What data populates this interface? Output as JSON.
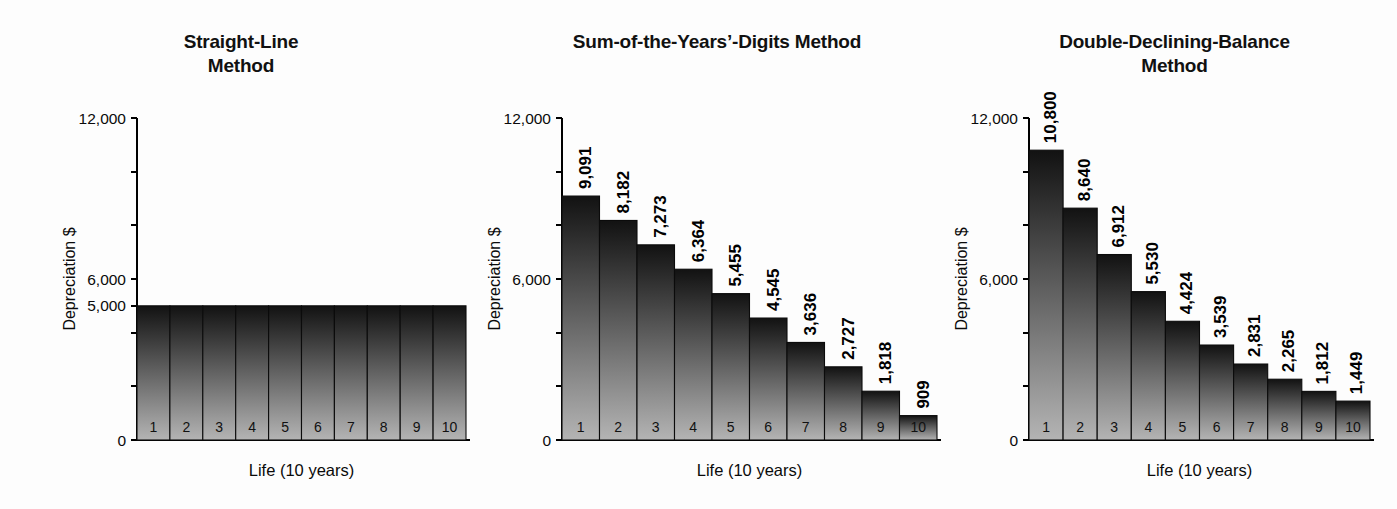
{
  "figure": {
    "background_color": "#fdfdfd",
    "bar_gradient_top_color": "#121212",
    "bar_gradient_bottom_color": "#b4b4b4",
    "axis_color": "#000000"
  },
  "chart_data": [
    {
      "type": "bar",
      "title": "Straight-Line\nMethod",
      "title_line1": "Straight-Line",
      "title_line2": "Method",
      "xlabel": "Life (10 years)",
      "ylabel": "Depreciation $",
      "categories": [
        "1",
        "2",
        "3",
        "4",
        "5",
        "6",
        "7",
        "8",
        "9",
        "10"
      ],
      "values": [
        5000,
        5000,
        5000,
        5000,
        5000,
        5000,
        5000,
        5000,
        5000,
        5000
      ],
      "value_labels": [
        "",
        "",
        "",
        "",
        "",
        "",
        "",
        "",
        "",
        ""
      ],
      "ylim": [
        0,
        12000
      ],
      "ytick_values": [
        0,
        2000,
        4000,
        5000,
        6000,
        8000,
        10000,
        12000
      ],
      "ytick_labels": [
        "0",
        "",
        "",
        "5,000",
        "6,000",
        "",
        "",
        "12,000"
      ],
      "grid": false,
      "legend": false,
      "show_value_labels": false
    },
    {
      "type": "bar",
      "title": "Sum-of-the-Years'-Digits Method",
      "title_line1": "Sum-of-the-Years’-Digits Method",
      "title_line2": "",
      "xlabel": "Life (10 years)",
      "ylabel": "Depreciation $",
      "categories": [
        "1",
        "2",
        "3",
        "4",
        "5",
        "6",
        "7",
        "8",
        "9",
        "10"
      ],
      "values": [
        9091,
        8182,
        7273,
        6364,
        5455,
        4545,
        3636,
        2727,
        1818,
        909
      ],
      "value_labels": [
        "9,091",
        "8,182",
        "7,273",
        "6,364",
        "5,455",
        "4,545",
        "3,636",
        "2,727",
        "1,818",
        "909"
      ],
      "ylim": [
        0,
        12000
      ],
      "ytick_values": [
        0,
        2000,
        4000,
        6000,
        8000,
        10000,
        12000
      ],
      "ytick_labels": [
        "0",
        "",
        "",
        "6,000",
        "",
        "",
        "12,000"
      ],
      "grid": false,
      "legend": false,
      "show_value_labels": true
    },
    {
      "type": "bar",
      "title": "Double-Declining-Balance\nMethod",
      "title_line1": "Double-Declining-Balance",
      "title_line2": "Method",
      "xlabel": "Life (10 years)",
      "ylabel": "Depreciation $",
      "categories": [
        "1",
        "2",
        "3",
        "4",
        "5",
        "6",
        "7",
        "8",
        "9",
        "10"
      ],
      "values": [
        10800,
        8640,
        6912,
        5530,
        4424,
        3539,
        2831,
        2265,
        1812,
        1449
      ],
      "value_labels": [
        "10,800",
        "8,640",
        "6,912",
        "5,530",
        "4,424",
        "3,539",
        "2,831",
        "2,265",
        "1,812",
        "1,449"
      ],
      "ylim": [
        0,
        12000
      ],
      "ytick_values": [
        0,
        2000,
        4000,
        6000,
        8000,
        10000,
        12000
      ],
      "ytick_labels": [
        "0",
        "",
        "",
        "6,000",
        "",
        "",
        "12,000"
      ],
      "grid": false,
      "legend": false,
      "show_value_labels": true
    }
  ]
}
